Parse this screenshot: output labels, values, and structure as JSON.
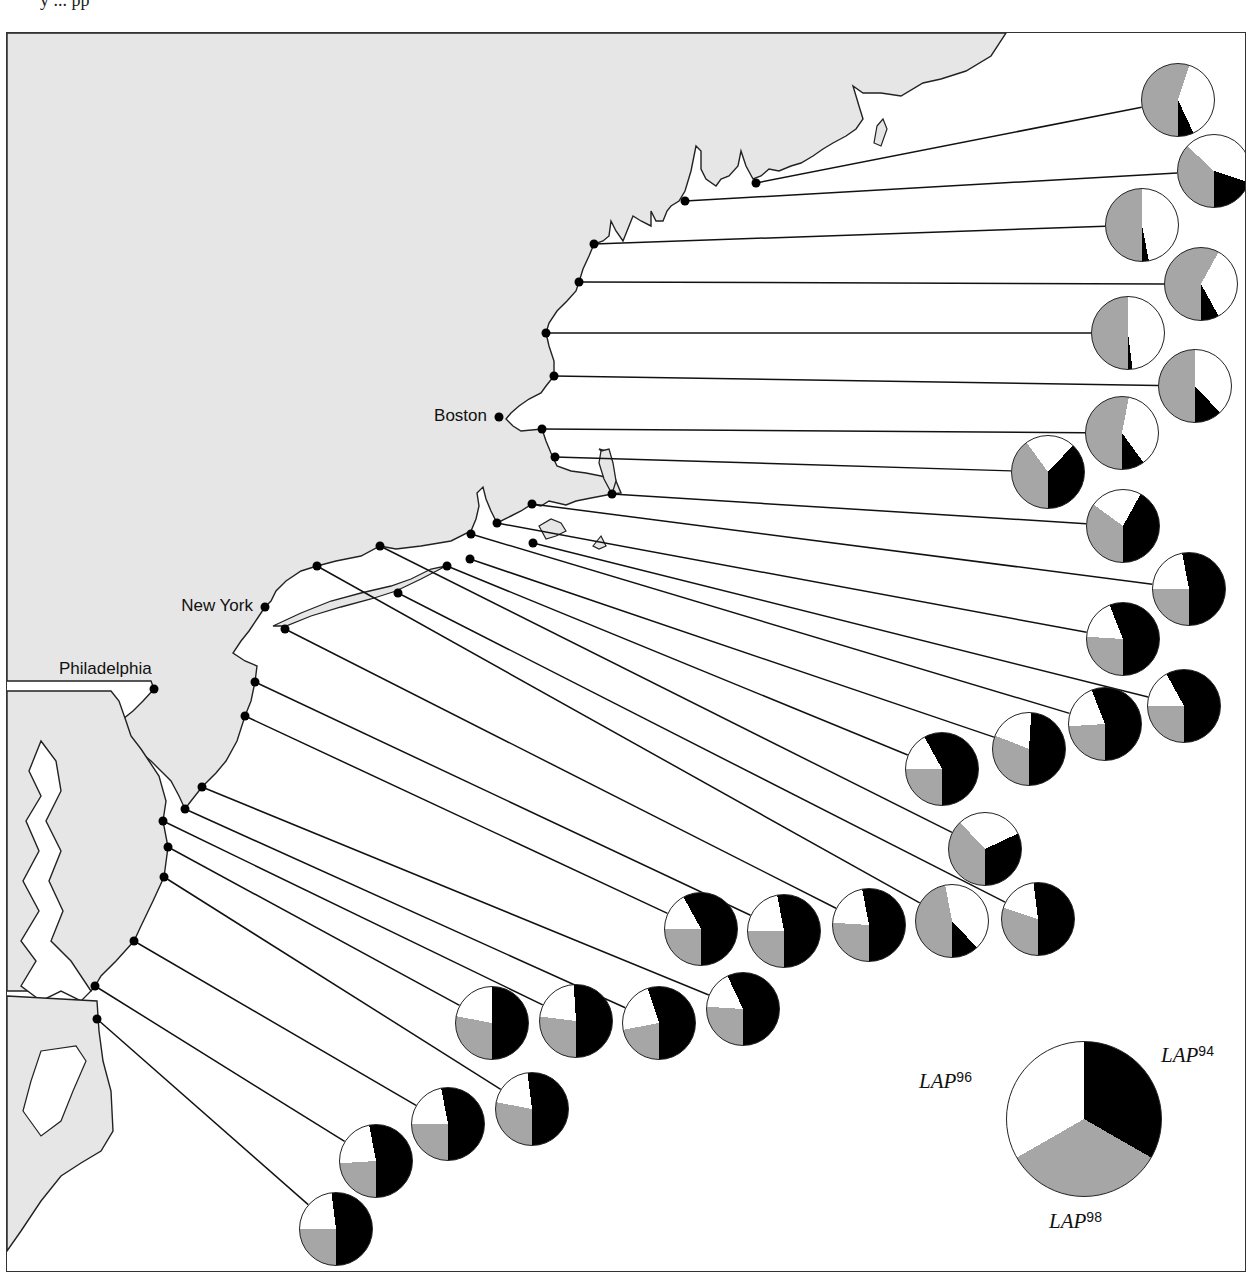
{
  "page": {
    "top_text_fragment": "y ... pp"
  },
  "colors": {
    "land": "#e6e6e6",
    "sea": "#ffffff",
    "LAP94": "#000000",
    "LAP96": "#ffffff",
    "LAP98": "#a6a6a6",
    "outline": "#222222"
  },
  "cities": [
    {
      "name": "Boston",
      "x": 498,
      "y": 416
    },
    {
      "name": "New York",
      "x": 264,
      "y": 606
    },
    {
      "name": "Philadelphia",
      "x": 153,
      "y": 688
    }
  ],
  "legend": {
    "labels": [
      {
        "allele": "LAP",
        "sup": "94",
        "slice": "black"
      },
      {
        "allele": "LAP",
        "sup": "96",
        "slice": "white"
      },
      {
        "allele": "LAP",
        "sup": "98",
        "slice": "gray"
      }
    ],
    "pie": {
      "cx": 1083,
      "cy": 1118,
      "r": 78,
      "LAP94": 33.3,
      "LAP96": 33.3,
      "LAP98": 33.4
    }
  },
  "chart_data": {
    "type": "pie",
    "title": "",
    "legend": [
      "LAP94",
      "LAP96",
      "LAP98"
    ],
    "sites": [
      {
        "id": 1,
        "site_x": 755,
        "site_y": 182,
        "cx": 1177,
        "cy": 99,
        "LAP94": 7,
        "LAP96": 38,
        "LAP98": 55
      },
      {
        "id": 2,
        "site_x": 684,
        "site_y": 200,
        "cx": 1213,
        "cy": 170,
        "LAP94": 20,
        "LAP96": 43,
        "LAP98": 37
      },
      {
        "id": 3,
        "site_x": 593,
        "site_y": 243,
        "cx": 1141,
        "cy": 224,
        "LAP94": 3,
        "LAP96": 47,
        "LAP98": 50
      },
      {
        "id": 4,
        "site_x": 578,
        "site_y": 281,
        "cx": 1200,
        "cy": 283,
        "LAP94": 8,
        "LAP96": 34,
        "LAP98": 58
      },
      {
        "id": 5,
        "site_x": 545,
        "site_y": 332,
        "cx": 1127,
        "cy": 332,
        "LAP94": 2,
        "LAP96": 48,
        "LAP98": 50
      },
      {
        "id": 6,
        "site_x": 553,
        "site_y": 375,
        "cx": 1194,
        "cy": 385,
        "LAP94": 12,
        "LAP96": 38,
        "LAP98": 50
      },
      {
        "id": 7,
        "site_x": 541,
        "site_y": 428,
        "cx": 1121,
        "cy": 432,
        "LAP94": 10,
        "LAP96": 37,
        "LAP98": 53
      },
      {
        "id": 8,
        "site_x": 554,
        "site_y": 456,
        "cx": 1047,
        "cy": 471,
        "LAP94": 38,
        "LAP96": 22,
        "LAP98": 40
      },
      {
        "id": 9,
        "site_x": 611,
        "site_y": 493,
        "cx": 1122,
        "cy": 525,
        "LAP94": 42,
        "LAP96": 23,
        "LAP98": 35
      },
      {
        "id": 10,
        "site_x": 531,
        "site_y": 503,
        "cx": 1188,
        "cy": 588,
        "LAP94": 53,
        "LAP96": 22,
        "LAP98": 25
      },
      {
        "id": 11,
        "site_x": 496,
        "site_y": 522,
        "cx": 1122,
        "cy": 638,
        "LAP94": 56,
        "LAP96": 18,
        "LAP98": 26
      },
      {
        "id": 12,
        "site_x": 532,
        "site_y": 542,
        "cx": 1183,
        "cy": 705,
        "LAP94": 58,
        "LAP96": 17,
        "LAP98": 25
      },
      {
        "id": 13,
        "site_x": 470,
        "site_y": 533,
        "cx": 1104,
        "cy": 723,
        "LAP94": 56,
        "LAP96": 20,
        "LAP98": 24
      },
      {
        "id": 14,
        "site_x": 469,
        "site_y": 558,
        "cx": 1028,
        "cy": 748,
        "LAP94": 49,
        "LAP96": 20,
        "LAP98": 31
      },
      {
        "id": 15,
        "site_x": 446,
        "site_y": 565,
        "cx": 941,
        "cy": 768,
        "LAP94": 58,
        "LAP96": 17,
        "LAP98": 25
      },
      {
        "id": 16,
        "site_x": 379,
        "site_y": 545,
        "cx": 984,
        "cy": 848,
        "LAP94": 32,
        "LAP96": 30,
        "LAP98": 38
      },
      {
        "id": 17,
        "site_x": 397,
        "site_y": 592,
        "cx": 1037,
        "cy": 918,
        "LAP94": 52,
        "LAP96": 18,
        "LAP98": 30
      },
      {
        "id": 18,
        "site_x": 316,
        "site_y": 565,
        "cx": 951,
        "cy": 920,
        "LAP94": 12,
        "LAP96": 41,
        "LAP98": 47
      },
      {
        "id": 19,
        "site_x": 284,
        "site_y": 628,
        "cx": 868,
        "cy": 924,
        "LAP94": 53,
        "LAP96": 21,
        "LAP98": 26
      },
      {
        "id": 20,
        "site_x": 254,
        "site_y": 681,
        "cx": 783,
        "cy": 930,
        "LAP94": 53,
        "LAP96": 22,
        "LAP98": 25
      },
      {
        "id": 21,
        "site_x": 244,
        "site_y": 715,
        "cx": 700,
        "cy": 928,
        "LAP94": 58,
        "LAP96": 17,
        "LAP98": 25
      },
      {
        "id": 22,
        "site_x": 201,
        "site_y": 786,
        "cx": 742,
        "cy": 1008,
        "LAP94": 57,
        "LAP96": 17,
        "LAP98": 26
      },
      {
        "id": 23,
        "site_x": 184,
        "site_y": 808,
        "cx": 658,
        "cy": 1022,
        "LAP94": 55,
        "LAP96": 23,
        "LAP98": 22
      },
      {
        "id": 24,
        "site_x": 162,
        "site_y": 820,
        "cx": 575,
        "cy": 1020,
        "LAP94": 51,
        "LAP96": 22,
        "LAP98": 27
      },
      {
        "id": 25,
        "site_x": 167,
        "site_y": 846,
        "cx": 491,
        "cy": 1022,
        "LAP94": 50,
        "LAP96": 22,
        "LAP98": 28
      },
      {
        "id": 26,
        "site_x": 163,
        "site_y": 876,
        "cx": 531,
        "cy": 1108,
        "LAP94": 52,
        "LAP96": 20,
        "LAP98": 28
      },
      {
        "id": 27,
        "site_x": 133,
        "site_y": 940,
        "cx": 447,
        "cy": 1123,
        "LAP94": 53,
        "LAP96": 22,
        "LAP98": 25
      },
      {
        "id": 28,
        "site_x": 94,
        "site_y": 985,
        "cx": 375,
        "cy": 1160,
        "LAP94": 53,
        "LAP96": 23,
        "LAP98": 24
      },
      {
        "id": 29,
        "site_x": 96,
        "site_y": 1018,
        "cx": 335,
        "cy": 1228,
        "LAP94": 52,
        "LAP96": 23,
        "LAP98": 25
      }
    ],
    "pie_radius": 37,
    "slice_order": "clockwise from bottom (6 o'clock): LAP98 gray, LAP96 white, LAP94 black"
  }
}
